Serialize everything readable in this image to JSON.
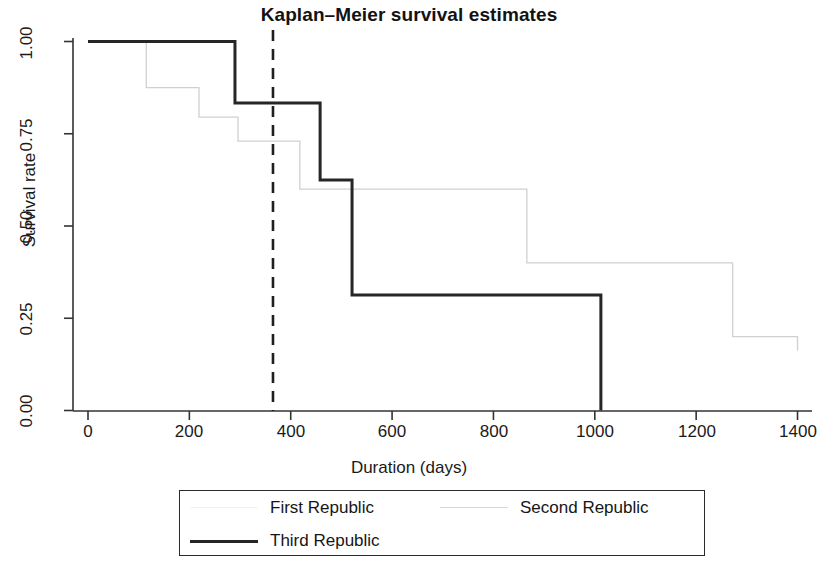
{
  "chart_data": {
    "type": "line",
    "title": "Kaplan–Meier survival estimates",
    "xlabel": "Duration (days)",
    "ylabel": "Survival rate",
    "xlim": [
      0,
      1430
    ],
    "ylim": [
      0,
      1.0
    ],
    "grid": false,
    "legend_position": "bottom",
    "xticks": [
      0,
      200,
      400,
      600,
      800,
      1000,
      1200,
      1400
    ],
    "xtick_labels": [
      "0",
      "200",
      "400",
      "600",
      "800",
      "1000",
      "1200",
      "1400"
    ],
    "yticks": [
      0.0,
      0.25,
      0.5,
      0.75,
      1.0
    ],
    "ytick_labels": [
      "0.00",
      "0.25",
      "0.50",
      "0.75",
      "1.00"
    ],
    "annotations": [
      {
        "type": "vertical-dashed-line",
        "x": 365,
        "label": ""
      }
    ],
    "series": [
      {
        "name": "First Republic",
        "color": "#f2f2f2",
        "width": 1,
        "style": "solid",
        "steps": [
          [
            0,
            1.0
          ]
        ]
      },
      {
        "name": "Second Republic",
        "color": "#d0d0d0",
        "width": 1.3,
        "style": "solid",
        "steps": [
          [
            0,
            1.0
          ],
          [
            115,
            0.875
          ],
          [
            219,
            0.795
          ],
          [
            296,
            0.73
          ],
          [
            418,
            0.6
          ],
          [
            866,
            0.4
          ],
          [
            1272,
            0.2
          ],
          [
            1400,
            0.2
          ]
        ]
      },
      {
        "name": "Third Republic",
        "color": "#262626",
        "width": 3,
        "style": "solid",
        "steps": [
          [
            0,
            1.0
          ],
          [
            290,
            0.833
          ],
          [
            458,
            0.625
          ],
          [
            521,
            0.313
          ],
          [
            1012,
            0.0
          ]
        ]
      }
    ]
  },
  "legend": {
    "entries": [
      {
        "label": "First Republic",
        "swatch": "first-republic-line"
      },
      {
        "label": "Second Republic",
        "swatch": "second-republic-line"
      },
      {
        "label": "Third Republic",
        "swatch": "third-republic-line"
      }
    ]
  }
}
